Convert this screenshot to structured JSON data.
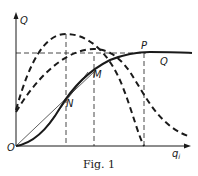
{
  "figure": {
    "caption": "Fig. 1",
    "axes": {
      "y_label": "Q",
      "x_label_base": "q",
      "x_label_sub": "i",
      "origin_label": "O"
    },
    "points": {
      "P": "P",
      "M": "M",
      "N": "N"
    },
    "curve_label": "Q",
    "colors": {
      "ink": "#1a1a1a",
      "background": "#ffffff"
    }
  }
}
